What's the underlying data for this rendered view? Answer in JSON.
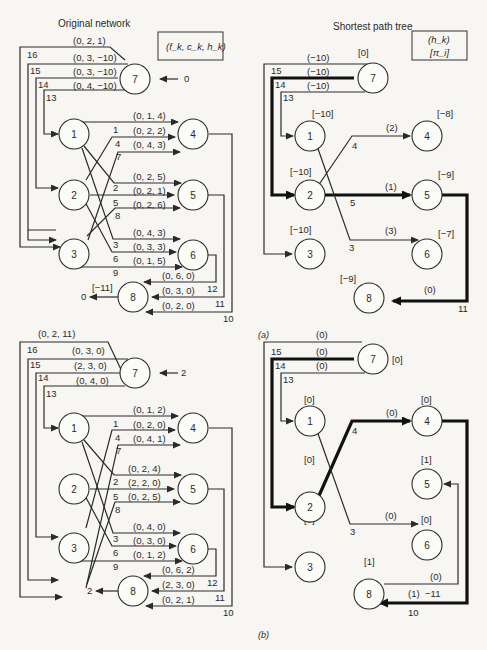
{
  "panel_a": {
    "caption": "(a)",
    "original": {
      "title": "Original network",
      "legend": "(f_k, c_k, h_k)",
      "supply_node7": "0",
      "supply_node8": "0",
      "potential_node8": "[−11]",
      "nodes": [
        "1",
        "2",
        "3",
        "4",
        "5",
        "6",
        "7",
        "8"
      ],
      "arcs": [
        {
          "id": "1",
          "from": "1",
          "to": "4",
          "label": "(0, 1, 4)"
        },
        {
          "id": "4",
          "from": "2",
          "to": "4",
          "label": "(0, 2, 2)"
        },
        {
          "id": "7",
          "from": "3",
          "to": "4",
          "label": "(0, 4, 3)"
        },
        {
          "id": "2",
          "from": "1",
          "to": "5",
          "label": "(0, 2, 5)"
        },
        {
          "id": "5",
          "from": "2",
          "to": "5",
          "label": "(0, 2, 1)"
        },
        {
          "id": "8",
          "from": "3",
          "to": "5",
          "label": "(0, 2, 6)"
        },
        {
          "id": "3",
          "from": "1",
          "to": "6",
          "label": "(0, 4, 3)"
        },
        {
          "id": "6",
          "from": "2",
          "to": "6",
          "label": "(0, 3, 3)"
        },
        {
          "id": "9",
          "from": "3",
          "to": "6",
          "label": "(0, 1, 5)"
        },
        {
          "id": "12",
          "from": "6",
          "to": "8",
          "label": "(0, 6, 0)"
        },
        {
          "id": "11",
          "from": "5",
          "to": "8",
          "label": "(0, 3, 0)"
        },
        {
          "id": "10",
          "from": "4",
          "to": "8",
          "label": "(0, 2, 0)"
        },
        {
          "id": "16",
          "from": "7",
          "to": "3",
          "label": "(0, 2, 1)"
        },
        {
          "id": "15",
          "from": "7",
          "to": "3",
          "label": "(0, 3, −10)"
        },
        {
          "id": "14",
          "from": "7",
          "to": "2",
          "label": "(0, 3, −10)"
        },
        {
          "id": "13",
          "from": "7",
          "to": "1",
          "label": "(0, 4, −10)"
        }
      ]
    },
    "tree": {
      "title": "Shortest path tree",
      "legend_top": "(h_k)",
      "legend_bottom": "[π_i]",
      "potentials": {
        "7": "[0]",
        "1": "[−10]",
        "2": "[−10]",
        "3": "[−10]",
        "4": "[−8]",
        "5": "[−9]",
        "6": "[−7]",
        "8": "[−9]"
      },
      "arc_labels": {
        "16": "(−10)",
        "15": "(−10)",
        "14": "(−10)",
        "4": "(2)",
        "5": "(1)",
        "3": "(3)",
        "11": "(0)"
      },
      "arc_ids": [
        "15",
        "14",
        "13",
        "4",
        "5",
        "3",
        "11"
      ]
    }
  },
  "panel_b": {
    "caption": "(b)",
    "original": {
      "supply_node7": "2",
      "supply_node8": "2",
      "arcs": [
        {
          "id": "16",
          "label": "(0, 2, 11)"
        },
        {
          "id": "15",
          "label": "(0, 3, 0)"
        },
        {
          "id": "14",
          "label": "(2, 3, 0)"
        },
        {
          "id": "13",
          "label": "(0, 4, 0)"
        },
        {
          "id": "1",
          "label": "(0, 1, 2)"
        },
        {
          "id": "4",
          "label": "(0, 2, 0)"
        },
        {
          "id": "7",
          "label": "(0, 4, 1)"
        },
        {
          "id": "2",
          "label": "(0, 2, 4)"
        },
        {
          "id": "5",
          "label": "(2, 2, 0)"
        },
        {
          "id": "8",
          "label": "(0, 2, 5)"
        },
        {
          "id": "3",
          "label": "(0, 4, 0)"
        },
        {
          "id": "6",
          "label": "(0, 3, 0)"
        },
        {
          "id": "9",
          "label": "(0, 1, 2)"
        },
        {
          "id": "12",
          "label": "(0, 6, 2)"
        },
        {
          "id": "11",
          "label": "(2, 3, 0)"
        },
        {
          "id": "10",
          "label": "(0, 2, 1)"
        }
      ]
    },
    "tree": {
      "potentials": {
        "7": "[0]",
        "1": "[0]",
        "2": "[0]",
        "3": "[0]",
        "4": "[0]",
        "5": "[1]",
        "6": "[0]",
        "8": "[1]"
      },
      "arc_labels": {
        "16": "(0)",
        "15": "(0)",
        "14": "(0)",
        "4": "(0)",
        "3": "(0)",
        "11": "(0)",
        "10": "(1)",
        "10_extra": "−11"
      },
      "arc_ids": [
        "15",
        "14",
        "13",
        "4",
        "3",
        "10"
      ]
    }
  }
}
